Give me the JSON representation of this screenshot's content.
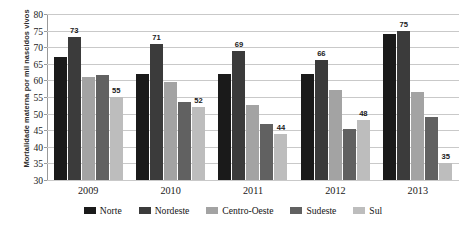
{
  "chart_data": {
    "type": "bar",
    "title": "",
    "xlabel": "",
    "ylabel": "Mortalidade materna por mil nascidos vivos",
    "ylim": [
      30,
      80
    ],
    "ytick_step": 5,
    "ytick_labels": [
      "80",
      "75",
      "70",
      "65",
      "60",
      "55",
      "50",
      "45",
      "40",
      "35",
      "30"
    ],
    "grid": true,
    "legend_position": "bottom",
    "categories": [
      "2009",
      "2010",
      "2011",
      "2012",
      "2013"
    ],
    "series": [
      {
        "name": "Norte",
        "color": "#1a1a1a",
        "values": [
          67,
          62,
          62,
          62,
          74
        ],
        "labels": [
          "",
          "",
          "",
          "",
          ""
        ]
      },
      {
        "name": "Nordeste",
        "color": "#3b3b3b",
        "values": [
          73,
          71,
          69,
          66,
          75
        ],
        "labels": [
          "73",
          "71",
          "69",
          "66",
          "75"
        ]
      },
      {
        "name": "Centro-Oeste",
        "color": "#a3a3a3",
        "values": [
          61,
          59.5,
          52.5,
          57,
          56.5
        ],
        "labels": [
          "",
          "",
          "",
          "",
          ""
        ]
      },
      {
        "name": "Sudeste",
        "color": "#616161",
        "values": [
          61.5,
          53.5,
          47,
          45.5,
          49
        ],
        "labels": [
          "",
          "",
          "",
          "",
          ""
        ]
      },
      {
        "name": "Sul",
        "color": "#bdbdbd",
        "values": [
          55,
          52,
          44,
          48,
          35
        ],
        "labels": [
          "55",
          "52",
          "44",
          "48",
          "35"
        ]
      }
    ]
  }
}
